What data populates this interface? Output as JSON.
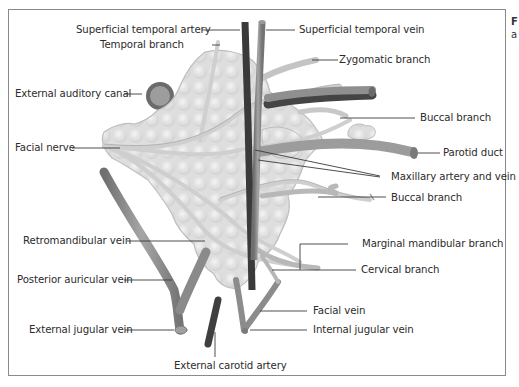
{
  "figure": {
    "caption_fragment": [
      "F",
      "a"
    ],
    "labels": {
      "superficial_temporal_artery": "Superficial temporal artery",
      "temporal_branch": "Temporal branch",
      "external_auditory_canal": "External auditory canal",
      "facial_nerve": "Facial nerve",
      "retromandibular_vein": "Retromandibular vein",
      "posterior_auricular_vein": "Posterior auricular vein",
      "external_jugular_vein": "External jugular vein",
      "external_carotid_artery": "External carotid artery",
      "superficial_temporal_vein": "Superficial temporal vein",
      "zygomatic_branch": "Zygomatic branch",
      "buccal_branch_upper": "Buccal branch",
      "parotid_duct": "Parotid duct",
      "maxillary_artery_and_vein": "Maxillary artery and vein",
      "buccal_branch_lower": "Buccal branch",
      "marginal_mandibular_branch": "Marginal mandibular branch",
      "cervical_branch": "Cervical branch",
      "facial_vein": "Facial vein",
      "internal_jugular_vein": "Internal jugular vein"
    },
    "colors": {
      "frame": "#8a8a8a",
      "gland": "#e3e3e3",
      "gland_edge": "#b9b9b9",
      "vein": "#8c8c8c",
      "artery": "#3d3d3d",
      "nerve": "#d6d6d6",
      "duct": "#a9a9a9",
      "leader": "#3a3a3a"
    }
  }
}
